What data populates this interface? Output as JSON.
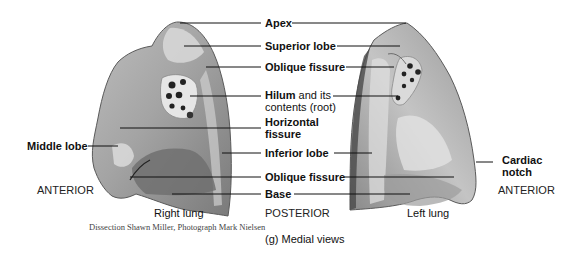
{
  "figure": {
    "caption": "(g) Medial views",
    "credit": "Dissection Shawn Miller, Photograph Mark Nielsen"
  },
  "center_labels": {
    "apex": "Apex",
    "superior_lobe": "Superior lobe",
    "oblique_fissure_top": "Oblique fissure",
    "hilum_bold": "Hilum",
    "hilum_rest": " and its",
    "hilum_line2": "contents (root)",
    "horizontal_line1": "Horizontal",
    "horizontal_line2": "fissure",
    "inferior_lobe": "Inferior lobe",
    "oblique_fissure_bottom": "Oblique fissure",
    "base": "Base",
    "posterior": "POSTERIOR"
  },
  "left_side": {
    "middle_lobe": "Middle lobe",
    "anterior": "ANTERIOR",
    "lung_name": "Right lung"
  },
  "right_side": {
    "cardiac_line1": "Cardiac",
    "cardiac_line2": "notch",
    "anterior": "ANTERIOR",
    "lung_name": "Left lung"
  },
  "colors": {
    "tissue_light": "#d9d9d9",
    "tissue_mid": "#a8a8a8",
    "tissue_dark": "#6e6e6e",
    "leader_line": "#111111"
  }
}
